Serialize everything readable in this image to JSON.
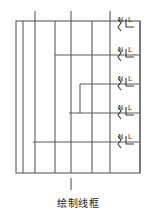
{
  "figure": {
    "caption": "绘制线框",
    "type": "electrical-wiring-schematic",
    "stroke_color": "#5a5a5a",
    "label_color": "#2b2b2b",
    "background_color": "#ffffff",
    "outer_box": {
      "x": 16,
      "y": 21,
      "width": 124,
      "height": 152
    },
    "outlets": [
      {
        "index": 1,
        "neutral_label": "N",
        "live_label": "L",
        "y": 25
      },
      {
        "index": 2,
        "neutral_label": "N",
        "live_label": "L",
        "y": 55
      },
      {
        "index": 3,
        "neutral_label": "N",
        "live_label": "L",
        "y": 84
      },
      {
        "index": 4,
        "neutral_label": "N",
        "live_label": "L",
        "y": 113
      },
      {
        "index": 5,
        "neutral_label": "N",
        "live_label": "L",
        "y": 142
      }
    ],
    "vertical_conductors": [
      {
        "name": "conductor-1",
        "x": 23
      },
      {
        "name": "conductor-2",
        "x": 35
      },
      {
        "name": "conductor-3",
        "x": 55
      },
      {
        "name": "conductor-4",
        "x": 71
      },
      {
        "name": "conductor-5",
        "x": 92
      },
      {
        "name": "conductor-6",
        "x": 110
      }
    ],
    "top_stubs": [
      {
        "name": "top-stub-1",
        "x": 35
      },
      {
        "name": "top-stub-2",
        "x": 71
      },
      {
        "name": "top-stub-3",
        "x": 110
      }
    ],
    "bottom_stub": {
      "name": "bottom-stub",
      "x": 71
    },
    "branch_rails": [
      {
        "name": "branch-rail-1",
        "x1": 16,
        "y": 21,
        "x2": 140
      },
      {
        "name": "branch-rail-2",
        "x1": 55,
        "y": 55,
        "x2": 140
      },
      {
        "name": "branch-rail-3",
        "x1": 80,
        "y": 84,
        "x2": 140
      },
      {
        "name": "branch-rail-4",
        "x1": 69,
        "y": 113,
        "x2": 140
      },
      {
        "name": "branch-rail-5",
        "x1": 33,
        "y": 142,
        "x2": 140
      }
    ]
  }
}
